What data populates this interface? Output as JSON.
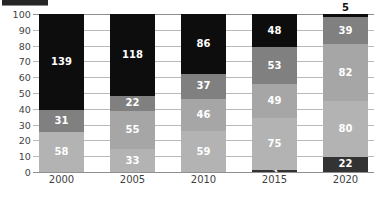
{
  "chart_data": {
    "type": "bar",
    "subtype": "stacked-100-percent-column",
    "title": "",
    "subtitle": "",
    "xlabel": "",
    "ylabel": "",
    "categories": [
      "2000",
      "2005",
      "2010",
      "2015",
      "2020"
    ],
    "ylim": [
      0,
      100
    ],
    "yticks": [
      0,
      10,
      20,
      30,
      40,
      50,
      60,
      70,
      80,
      90,
      100
    ],
    "ytick_labels": [
      "0",
      "10",
      "20",
      "30",
      "40",
      "50",
      "60",
      "70",
      "80",
      "90",
      "100"
    ],
    "grid": true,
    "legend": "cut-off-top-left",
    "series": [
      {
        "name": "series-1-bottom",
        "color": "#333333",
        "values": [
          null,
          null,
          null,
          3,
          22
        ],
        "labels": [
          "",
          "",
          "",
          "3",
          "22"
        ]
      },
      {
        "name": "series-2",
        "color": "#b3b3b3",
        "values": [
          58,
          33,
          59,
          75,
          80
        ],
        "labels": [
          "58",
          "33",
          "59",
          "75",
          "80"
        ]
      },
      {
        "name": "series-3",
        "color": "#a6a6a6",
        "values": [
          null,
          55,
          46,
          49,
          82
        ],
        "labels": [
          "",
          "55",
          "46",
          "49",
          "82"
        ]
      },
      {
        "name": "series-4",
        "color": "#808080",
        "values": [
          31,
          22,
          37,
          53,
          39
        ],
        "labels": [
          "31",
          "22",
          "37",
          "53",
          "39"
        ]
      },
      {
        "name": "series-5-top",
        "color": "#0d0d0d",
        "values": [
          139,
          118,
          86,
          48,
          5
        ],
        "labels": [
          "139",
          "118",
          "86",
          "48",
          "5"
        ]
      }
    ]
  },
  "columns": [
    {
      "category": "2000",
      "total": 228,
      "segments": [
        {
          "label": "139",
          "value": 139,
          "percent": 60.96,
          "color": "#0d0d0d",
          "text_color": "#ffffff",
          "show_label": true,
          "label_outside": false
        },
        {
          "label": "31",
          "value": 31,
          "percent": 13.6,
          "color": "#808080",
          "text_color": "#ffffff",
          "show_label": true,
          "label_outside": false
        },
        {
          "label": "58",
          "value": 58,
          "percent": 25.44,
          "color": "#b3b3b3",
          "text_color": "#ffffff",
          "show_label": true,
          "label_outside": false
        }
      ]
    },
    {
      "category": "2005",
      "total": 228,
      "segments": [
        {
          "label": "118",
          "value": 118,
          "percent": 51.75,
          "color": "#0d0d0d",
          "text_color": "#ffffff",
          "show_label": true,
          "label_outside": false
        },
        {
          "label": "22",
          "value": 22,
          "percent": 9.65,
          "color": "#808080",
          "text_color": "#ffffff",
          "show_label": true,
          "label_outside": false
        },
        {
          "label": "55",
          "value": 55,
          "percent": 24.12,
          "color": "#a6a6a6",
          "text_color": "#ffffff",
          "show_label": true,
          "label_outside": false
        },
        {
          "label": "33",
          "value": 33,
          "percent": 14.48,
          "color": "#b3b3b3",
          "text_color": "#ffffff",
          "show_label": true,
          "label_outside": false
        }
      ]
    },
    {
      "category": "2010",
      "total": 228,
      "segments": [
        {
          "label": "86",
          "value": 86,
          "percent": 37.72,
          "color": "#0d0d0d",
          "text_color": "#ffffff",
          "show_label": true,
          "label_outside": false
        },
        {
          "label": "37",
          "value": 37,
          "percent": 16.23,
          "color": "#808080",
          "text_color": "#ffffff",
          "show_label": true,
          "label_outside": false
        },
        {
          "label": "46",
          "value": 46,
          "percent": 20.18,
          "color": "#a6a6a6",
          "text_color": "#ffffff",
          "show_label": true,
          "label_outside": false
        },
        {
          "label": "59",
          "value": 59,
          "percent": 25.87,
          "color": "#b3b3b3",
          "text_color": "#ffffff",
          "show_label": true,
          "label_outside": false
        }
      ]
    },
    {
      "category": "2015",
      "total": 228,
      "segments": [
        {
          "label": "48",
          "value": 48,
          "percent": 21.05,
          "color": "#0d0d0d",
          "text_color": "#ffffff",
          "show_label": true,
          "label_outside": false
        },
        {
          "label": "53",
          "value": 53,
          "percent": 23.25,
          "color": "#808080",
          "text_color": "#ffffff",
          "show_label": true,
          "label_outside": false
        },
        {
          "label": "49",
          "value": 49,
          "percent": 21.49,
          "color": "#a6a6a6",
          "text_color": "#ffffff",
          "show_label": true,
          "label_outside": false
        },
        {
          "label": "75",
          "value": 75,
          "percent": 32.9,
          "color": "#b3b3b3",
          "text_color": "#ffffff",
          "show_label": true,
          "label_outside": false
        },
        {
          "label": "3",
          "value": 3,
          "percent": 1.31,
          "color": "#333333",
          "text_color": "#ffffff",
          "show_label": true,
          "label_outside": false
        }
      ]
    },
    {
      "category": "2020",
      "total": 228,
      "segments": [
        {
          "label": "5",
          "value": 5,
          "percent": 2.19,
          "color": "#0d0d0d",
          "text_color": "#111111",
          "show_label": true,
          "label_outside": true
        },
        {
          "label": "39",
          "value": 39,
          "percent": 17.11,
          "color": "#808080",
          "text_color": "#ffffff",
          "show_label": true,
          "label_outside": false
        },
        {
          "label": "82",
          "value": 82,
          "percent": 35.96,
          "color": "#a6a6a6",
          "text_color": "#ffffff",
          "show_label": true,
          "label_outside": false
        },
        {
          "label": "80",
          "value": 80,
          "percent": 35.09,
          "color": "#b3b3b3",
          "text_color": "#ffffff",
          "show_label": true,
          "label_outside": false
        },
        {
          "label": "22",
          "value": 22,
          "percent": 9.65,
          "color": "#333333",
          "text_color": "#ffffff",
          "show_label": true,
          "label_outside": false
        }
      ]
    }
  ],
  "colors": {
    "black": "#0d0d0d",
    "dark_gray": "#808080",
    "medium_gray": "#a6a6a6",
    "light_gray": "#b3b3b3",
    "very_dark": "#333333",
    "gridline": "#b9b9b9",
    "axis": "#8f8f8f",
    "tick_text": "#3f3f3f",
    "background": "#ffffff"
  }
}
